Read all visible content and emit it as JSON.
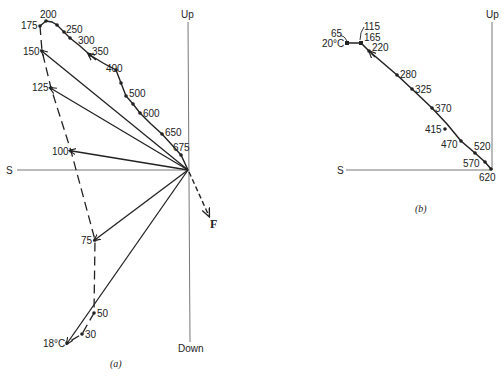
{
  "diagram_a": {
    "caption": "(a)",
    "axes": {
      "up": "Up",
      "down": "Down",
      "south": "S"
    },
    "resultant_label": "F",
    "upper_points": [
      {
        "label": "175",
        "x": 40,
        "y": 26
      },
      {
        "label": "200",
        "x": 46,
        "y": 21
      },
      {
        "label": "250",
        "x": 57,
        "y": 25
      },
      {
        "label": "300",
        "x": 70,
        "y": 38
      },
      {
        "label": "350",
        "x": 90,
        "y": 55
      },
      {
        "label": "400",
        "x": 116,
        "y": 70
      },
      {
        "label": "500",
        "x": 126,
        "y": 96
      },
      {
        "label": "600",
        "x": 140,
        "y": 113
      },
      {
        "label": "650",
        "x": 162,
        "y": 134
      },
      {
        "label": "675",
        "x": 181,
        "y": 155
      }
    ],
    "lower_points": [
      {
        "label": "150",
        "x": 42,
        "y": 51
      },
      {
        "label": "125",
        "x": 51,
        "y": 88
      },
      {
        "label": "100",
        "x": 71,
        "y": 151
      },
      {
        "label": "75",
        "x": 95,
        "y": 240
      },
      {
        "label": "50",
        "x": 94,
        "y": 313
      },
      {
        "label": "30",
        "x": 82,
        "y": 334
      },
      {
        "label": "18°C",
        "x": 67,
        "y": 343
      }
    ]
  },
  "diagram_b": {
    "caption": "(b)",
    "axes": {
      "up": "Up",
      "south": "S"
    },
    "points": [
      {
        "label": "20°C",
        "x": 347,
        "y": 43
      },
      {
        "label": "65",
        "x": 348,
        "y": 43
      },
      {
        "label": "115",
        "x": 361,
        "y": 43
      },
      {
        "label": "165",
        "x": 361,
        "y": 43
      },
      {
        "label": "220",
        "x": 369,
        "y": 51
      },
      {
        "label": "280",
        "x": 397,
        "y": 75
      },
      {
        "label": "325",
        "x": 412,
        "y": 89
      },
      {
        "label": "370",
        "x": 432,
        "y": 108
      },
      {
        "label": "415",
        "x": 445,
        "y": 129
      },
      {
        "label": "470",
        "x": 461,
        "y": 141
      },
      {
        "label": "520",
        "x": 475,
        "y": 153
      },
      {
        "label": "570",
        "x": 485,
        "y": 162
      },
      {
        "label": "620",
        "x": 491,
        "y": 169
      }
    ]
  }
}
